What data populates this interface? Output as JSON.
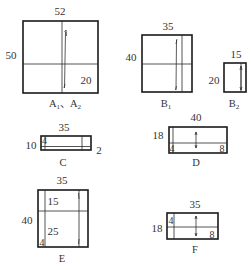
{
  "diagram": {
    "type": "cutting-layout-panels",
    "panels": [
      {
        "id": "A",
        "name": "A1, A2",
        "name_main": "A",
        "name_parts": [
          "A",
          "1",
          "、",
          "A",
          "2"
        ],
        "width_label": "52",
        "height_label": "50",
        "inner_labels": [
          "20"
        ]
      },
      {
        "id": "B1",
        "name_main": "B",
        "name_sub": "1",
        "width_label": "35",
        "height_label": "40"
      },
      {
        "id": "B2",
        "name_main": "B",
        "name_sub": "2",
        "width_label": "15",
        "height_label": "20"
      },
      {
        "id": "C",
        "name_main": "C",
        "width_label": "35",
        "height_label": "10",
        "side_label": "2",
        "inner_labels": [
          "4"
        ]
      },
      {
        "id": "D",
        "name_main": "D",
        "width_label": "40",
        "height_label": "18",
        "inner_labels": [
          "4",
          "8"
        ]
      },
      {
        "id": "E",
        "name_main": "E",
        "width_label": "35",
        "height_label": "40",
        "inner_labels": [
          "15",
          "25",
          "4"
        ]
      },
      {
        "id": "F",
        "name_main": "F",
        "width_label": "35",
        "height_label": "18",
        "inner_labels": [
          "4",
          "8"
        ]
      }
    ]
  }
}
